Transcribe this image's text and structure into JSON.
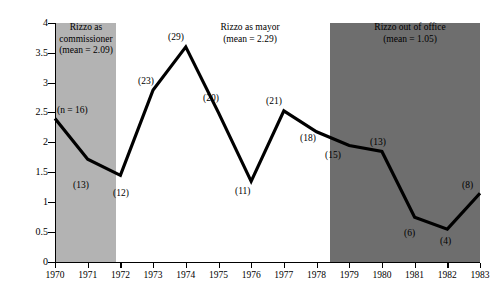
{
  "chart_data": {
    "type": "line",
    "title": "",
    "xlabel": "",
    "ylabel": "",
    "xlim": [
      1970,
      1983
    ],
    "ylim": [
      0,
      4
    ],
    "grid": false,
    "legend": "none",
    "x": [
      1970,
      1971,
      1972,
      1973,
      1974,
      1975,
      1976,
      1977,
      1978,
      1979,
      1980,
      1981,
      1982,
      1983
    ],
    "series": [
      {
        "name": "rating",
        "values": [
          2.4,
          1.72,
          1.45,
          2.88,
          3.6,
          2.5,
          1.35,
          2.53,
          2.18,
          1.95,
          1.85,
          0.75,
          0.55,
          1.15
        ]
      }
    ],
    "point_labels": [
      "(n = 16)",
      "(13)",
      "(12)",
      "(23)",
      "(29)",
      "(20)",
      "(11)",
      "(21)",
      "(18)",
      "(15)",
      "(13)",
      "(6)",
      "(4)",
      "(8)"
    ],
    "ytick_labels": [
      "0",
      "0.5",
      "1",
      "1.5",
      "2",
      "2.5",
      "3",
      "3.5",
      "4"
    ],
    "ytick_values": [
      0,
      0.5,
      1,
      1.5,
      2,
      2.5,
      3,
      3.5,
      4
    ],
    "xtick_labels": [
      "1970",
      "1971",
      "1972",
      "1973",
      "1974",
      "1975",
      "1976",
      "1977",
      "1978",
      "1979",
      "1980",
      "1981",
      "1982",
      "1983"
    ],
    "bands": [
      {
        "id": "commissioner",
        "label": "Rizzo as\ncommissioner\n(mean = 2.09)",
        "start": 1970,
        "end": 1972,
        "color": "#b3b3b3",
        "mean": 2.09
      },
      {
        "id": "mayor",
        "label": "Rizzo as mayor\n(mean = 2.29)",
        "start": 1972,
        "end": 1979,
        "color": "#ffffff",
        "mean": 2.29
      },
      {
        "id": "out-of-office",
        "label": "Rizzo out of office\n(mean = 1.05)",
        "start": 1979,
        "end": 1983,
        "color": "#6e6e6e",
        "mean": 1.05
      }
    ],
    "line_color": "#000000"
  }
}
